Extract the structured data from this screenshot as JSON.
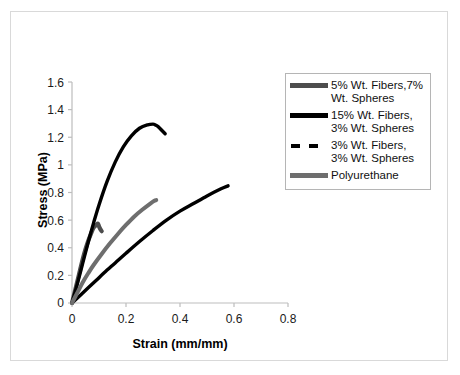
{
  "chart_data": {
    "type": "line",
    "title": "",
    "xlabel": "Strain (mm/mm)",
    "ylabel": "Stress (MPa)",
    "xlim": [
      0,
      0.8
    ],
    "ylim": [
      0,
      1.6
    ],
    "xticks": [
      "0",
      "0.2",
      "0.4",
      "0.6",
      "0.8"
    ],
    "yticks": [
      "0",
      "0.2",
      "0.4",
      "0.6",
      "0.8",
      "1",
      "1.2",
      "1.4",
      "1.6"
    ],
    "grid": false,
    "legend_position": "right",
    "series": [
      {
        "name": "5% Wt. Fibers,7% Wt. Spheres",
        "color": "#4d4d4d",
        "style": "solid",
        "x": [
          0.0,
          0.01,
          0.02,
          0.03,
          0.04,
          0.05,
          0.06,
          0.07,
          0.08,
          0.09,
          0.096,
          0.1,
          0.105,
          0.11
        ],
        "y": [
          0.0,
          0.08,
          0.16,
          0.24,
          0.32,
          0.39,
          0.45,
          0.5,
          0.545,
          0.565,
          0.575,
          0.555,
          0.535,
          0.52
        ]
      },
      {
        "name": "15% Wt. Fibers, 3% Wt. Spheres",
        "color": "#000000",
        "style": "solid",
        "x": [
          0.0,
          0.02,
          0.04,
          0.06,
          0.08,
          0.1,
          0.13,
          0.16,
          0.19,
          0.22,
          0.25,
          0.28,
          0.3,
          0.307,
          0.32,
          0.335,
          0.345
        ],
        "y": [
          0.0,
          0.14,
          0.29,
          0.44,
          0.58,
          0.71,
          0.88,
          1.02,
          1.13,
          1.21,
          1.265,
          1.29,
          1.295,
          1.29,
          1.275,
          1.245,
          1.225
        ]
      },
      {
        "name": "3% Wt. Fibers, 3% Wt. Spheres",
        "color": "#000000",
        "style": "dashed",
        "x": [
          0.0,
          0.03,
          0.06,
          0.09,
          0.12,
          0.16,
          0.2,
          0.25,
          0.3,
          0.35,
          0.4,
          0.45,
          0.5,
          0.55,
          0.578
        ],
        "y": [
          0.0,
          0.055,
          0.11,
          0.165,
          0.22,
          0.29,
          0.36,
          0.445,
          0.525,
          0.6,
          0.665,
          0.72,
          0.775,
          0.825,
          0.848
        ]
      },
      {
        "name": "Polyurethane",
        "color": "#6e6e6e",
        "style": "solid",
        "x": [
          0.0,
          0.02,
          0.04,
          0.06,
          0.08,
          0.11,
          0.14,
          0.17,
          0.2,
          0.23,
          0.26,
          0.29,
          0.305,
          0.312
        ],
        "y": [
          0.0,
          0.075,
          0.15,
          0.215,
          0.275,
          0.355,
          0.43,
          0.5,
          0.565,
          0.625,
          0.675,
          0.72,
          0.74,
          0.745
        ]
      }
    ]
  },
  "legend": {
    "entries": [
      {
        "label": "5% Wt. Fibers,7% Wt. Spheres",
        "swatch": "thick-gray-line-swatch"
      },
      {
        "label": "15% Wt. Fibers, 3% Wt. Spheres",
        "swatch": "thick-black-line-swatch"
      },
      {
        "label": "3% Wt. Fibers, 3% Wt. Spheres",
        "swatch": "dashed-black-line-swatch"
      },
      {
        "label": "Polyurethane",
        "swatch": "medium-gray-line-swatch"
      }
    ]
  },
  "axes": {
    "x_title": "Strain (mm/mm)",
    "y_title": "Stress (MPa)",
    "x_tick_labels": [
      "0",
      "0.2",
      "0.4",
      "0.6",
      "0.8"
    ],
    "y_tick_labels": [
      "1.6",
      "1.4",
      "1.2",
      "1",
      "0.8",
      "0.6",
      "0.4",
      "0.2",
      "0"
    ]
  },
  "colors": {
    "axis": "#bdbdbd",
    "text": "#111111",
    "frame": "#d9d9d9",
    "legend_border": "#b5b5b5"
  }
}
